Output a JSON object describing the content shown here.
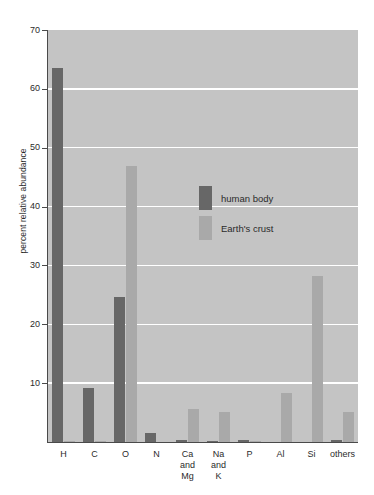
{
  "chart_data": {
    "type": "bar",
    "title": "",
    "xlabel": "",
    "ylabel": "percent relative abundance",
    "ylim": [
      0,
      70
    ],
    "yticks": [
      10,
      20,
      30,
      40,
      50,
      60,
      70
    ],
    "grid": true,
    "legend_position": "inside-upper-center",
    "categories": [
      "H",
      "C",
      "O",
      "N",
      "Ca and Mg",
      "Na and K",
      "P",
      "Al",
      "Si",
      "others"
    ],
    "category_lines": [
      [
        "H"
      ],
      [
        "C"
      ],
      [
        "O"
      ],
      [
        "N"
      ],
      [
        "Ca",
        "and",
        "Mg"
      ],
      [
        "Na",
        "and",
        "K"
      ],
      [
        "P"
      ],
      [
        "Al"
      ],
      [
        "Si"
      ],
      [
        "others"
      ]
    ],
    "series": [
      {
        "name": "human body",
        "color": "#676767",
        "values": [
          63.5,
          9.2,
          24.6,
          1.5,
          0.3,
          0.2,
          0.3,
          0.0,
          0.0,
          0.3
        ]
      },
      {
        "name": "Earth's crust",
        "color": "#a9a9a9",
        "values": [
          0.2,
          0.2,
          46.9,
          0.0,
          5.6,
          5.1,
          0.2,
          8.3,
          28.2,
          5.1
        ]
      }
    ]
  },
  "legend": {
    "items": [
      {
        "label": "human body",
        "color": "#676767"
      },
      {
        "label": "Earth's crust",
        "color": "#a9a9a9"
      }
    ]
  },
  "colors": {
    "plot_background": "#c4c4c4",
    "gridline": "#ffffff",
    "axis": "#4a4a4a",
    "human_body": "#676767",
    "earths_crust": "#a9a9a9",
    "text": "#2b2b2b"
  }
}
